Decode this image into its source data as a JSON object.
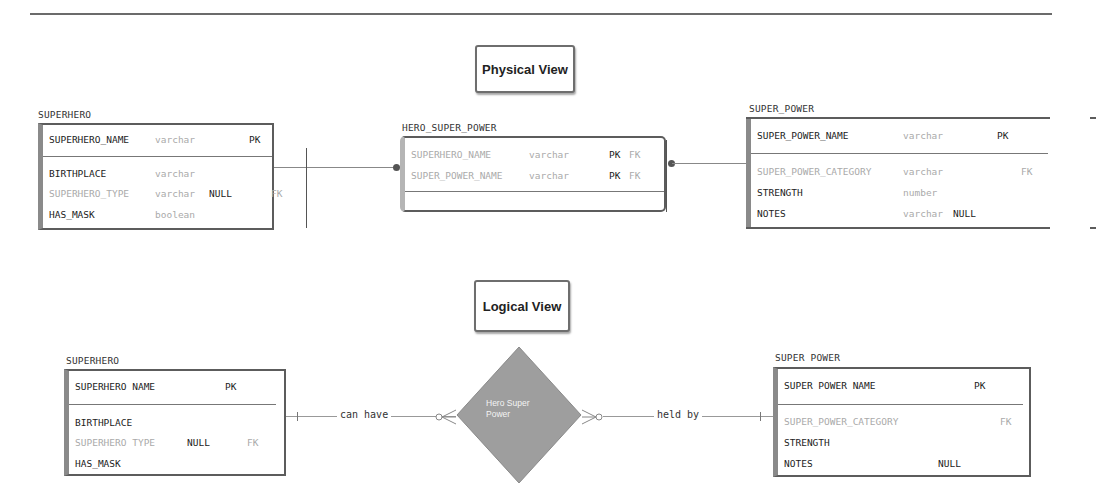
{
  "physical_view": {
    "label": "Physical View",
    "entities": {
      "superhero": {
        "title": "SUPERHERO",
        "key_rows": [
          {
            "name": "SUPERHERO_NAME",
            "type": "varchar",
            "null": "",
            "pk": "PK",
            "fk": "",
            "dim": false
          }
        ],
        "rows": [
          {
            "name": "BIRTHPLACE",
            "type": "varchar",
            "null": "",
            "pk": "",
            "fk": "",
            "dim": false
          },
          {
            "name": "SUPERHERO_TYPE",
            "type": "varchar",
            "null": "NULL",
            "pk": "",
            "fk": "FK",
            "dim": true
          },
          {
            "name": "HAS_MASK",
            "type": "boolean",
            "null": "",
            "pk": "",
            "fk": "",
            "dim": false
          }
        ]
      },
      "hero_super_power": {
        "title": "HERO_SUPER_POWER",
        "key_rows": [
          {
            "name": "SUPERHERO_NAME",
            "type": "varchar",
            "pk": "PK",
            "fk": "FK",
            "dim": true
          },
          {
            "name": "SUPER_POWER_NAME",
            "type": "varchar",
            "pk": "PK",
            "fk": "FK",
            "dim": true
          }
        ],
        "rows": []
      },
      "super_power": {
        "title": "SUPER_POWER",
        "key_rows": [
          {
            "name": "SUPER_POWER_NAME",
            "type": "varchar",
            "null": "",
            "pk": "PK",
            "fk": "",
            "dim": false
          }
        ],
        "rows": [
          {
            "name": "SUPER_POWER_CATEGORY",
            "type": "varchar",
            "null": "",
            "pk": "",
            "fk": "FK",
            "dim": true
          },
          {
            "name": "STRENGTH",
            "type": "number",
            "null": "",
            "pk": "",
            "fk": "",
            "dim": false
          },
          {
            "name": "NOTES",
            "type": "varchar",
            "null": "NULL",
            "pk": "",
            "fk": "",
            "dim": false
          }
        ]
      }
    }
  },
  "logical_view": {
    "label": "Logical View",
    "relationship": {
      "name": "Hero Super Power",
      "name_line1": "Hero Super",
      "name_line2": "Power",
      "left_label": "can have",
      "right_label": "held by"
    },
    "entities": {
      "superhero": {
        "title": "SUPERHERO",
        "key_rows": [
          {
            "name": "SUPERHERO NAME",
            "null": "",
            "pk": "PK",
            "fk": "",
            "dim": false
          }
        ],
        "rows": [
          {
            "name": "BIRTHPLACE",
            "null": "",
            "pk": "",
            "fk": "",
            "dim": false
          },
          {
            "name": "SUPERHERO TYPE",
            "null": "NULL",
            "pk": "",
            "fk": "FK",
            "dim": true
          },
          {
            "name": "HAS_MASK",
            "null": "",
            "pk": "",
            "fk": "",
            "dim": false
          }
        ]
      },
      "super_power": {
        "title": "SUPER POWER",
        "key_rows": [
          {
            "name": "SUPER POWER NAME",
            "null": "",
            "pk": "PK",
            "fk": "",
            "dim": false
          }
        ],
        "rows": [
          {
            "name": "SUPER_POWER_CATEGORY",
            "null": "",
            "pk": "",
            "fk": "FK",
            "dim": true
          },
          {
            "name": "STRENGTH",
            "null": "",
            "pk": "",
            "fk": "",
            "dim": false
          },
          {
            "name": "NOTES",
            "null": "NULL",
            "pk": "",
            "fk": "",
            "dim": false
          }
        ]
      }
    }
  },
  "colors": {
    "border": "#5c5c5c",
    "diamond_fill": "#9e9e9e",
    "dim_text": "#aaaaaa"
  }
}
